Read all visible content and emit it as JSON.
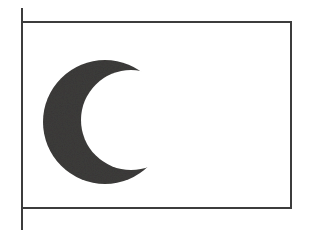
{
  "scene": {
    "title": "Crescent Moon Flag",
    "type": "line-art illustration",
    "canvas": {
      "width": 315,
      "height": 237
    },
    "background_color": "#ffffff"
  },
  "flagpole": {
    "name": "flagpole",
    "color": "#3c3c3c",
    "thickness": 2,
    "x": 22,
    "y_top": 8,
    "y_bottom": 230
  },
  "banner": {
    "name": "flag-banner",
    "fill_color": "#ffffff",
    "border_color": "#3c3c3c",
    "border_thickness": 2,
    "x": 22,
    "y": 22,
    "width": 269,
    "height": 186
  },
  "emblem": {
    "name": "crescent-moon",
    "label": "crescent moon",
    "fill_color": "#3d3c3b",
    "orientation": "horns point right",
    "outer_circle": {
      "cx": 105,
      "cy": 122,
      "r": 62
    },
    "inner_circle": {
      "cx": 131,
      "cy": 120,
      "r": 50
    },
    "bounds": {
      "x": 43,
      "y": 60,
      "width": 97,
      "height": 124
    }
  }
}
